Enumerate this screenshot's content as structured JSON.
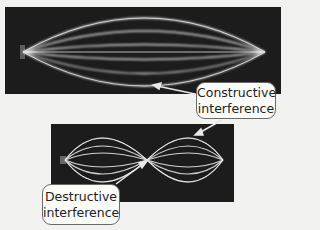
{
  "figure": {
    "top_panel": {
      "label": "standing-wave-single-loop",
      "background_color": "#1c1c1c",
      "line_color": "#d8d8d8"
    },
    "bottom_panel": {
      "label": "standing-wave-two-loops",
      "background_color": "#1c1c1c",
      "line_color": "#d8d8d8"
    },
    "callouts": {
      "constructive": {
        "line1": "Constructive",
        "line2": "interference"
      },
      "destructive": {
        "line1": "Destructive",
        "line2": "interference"
      }
    },
    "arrow_color": "#e8e8e8"
  }
}
